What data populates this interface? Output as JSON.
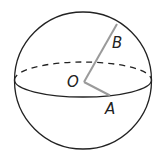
{
  "diagram": {
    "type": "sphere",
    "labels": {
      "center": "O",
      "point_a": "A",
      "point_b": "B"
    },
    "colors": {
      "outline": "#222222",
      "radius_lines": "#9a9a9a",
      "background": "#ffffff"
    }
  }
}
